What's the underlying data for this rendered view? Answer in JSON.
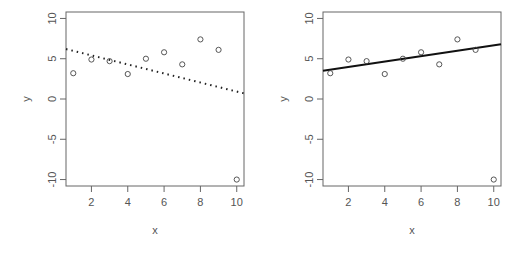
{
  "chart_data": [
    {
      "type": "scatter",
      "panel": "left",
      "title": "",
      "xlabel": "x",
      "ylabel": "y",
      "xlim": [
        0.6,
        10.4
      ],
      "ylim": [
        -10.8,
        10.8
      ],
      "xticks": [
        2,
        4,
        6,
        8,
        10
      ],
      "yticks": [
        -10,
        -5,
        0,
        5,
        10
      ],
      "grid": false,
      "x": [
        1,
        2,
        3,
        4,
        5,
        6,
        7,
        8,
        9,
        10
      ],
      "y": [
        3.2,
        4.9,
        4.7,
        3.1,
        5.0,
        5.8,
        4.3,
        7.4,
        6.1,
        -10.0
      ],
      "fit_line": {
        "style": "dotted",
        "x": [
          0.6,
          10.4
        ],
        "y": [
          6.2,
          0.7
        ],
        "color": "#222222"
      }
    },
    {
      "type": "scatter",
      "panel": "right",
      "title": "",
      "xlabel": "x",
      "ylabel": "y",
      "xlim": [
        0.6,
        10.4
      ],
      "ylim": [
        -10.8,
        10.8
      ],
      "xticks": [
        2,
        4,
        6,
        8,
        10
      ],
      "yticks": [
        -10,
        -5,
        0,
        5,
        10
      ],
      "grid": false,
      "x": [
        1,
        2,
        3,
        4,
        5,
        6,
        7,
        8,
        9,
        10
      ],
      "y": [
        3.2,
        4.9,
        4.7,
        3.1,
        5.0,
        5.8,
        4.3,
        7.4,
        6.1,
        -10.0
      ],
      "fit_line": {
        "style": "solid",
        "x": [
          0.6,
          10.4
        ],
        "y": [
          3.5,
          6.8
        ],
        "color": "#111111"
      }
    }
  ],
  "labels": {
    "left": {
      "xlabel": "x",
      "ylabel": "y",
      "xticks": [
        "2",
        "4",
        "6",
        "8",
        "10"
      ],
      "yticks": [
        "-10",
        "-5",
        "0",
        "5",
        "10"
      ]
    },
    "right": {
      "xlabel": "x",
      "ylabel": "y",
      "xticks": [
        "2",
        "4",
        "6",
        "8",
        "10"
      ],
      "yticks": [
        "-10",
        "-5",
        "0",
        "5",
        "10"
      ]
    }
  },
  "colors": {
    "axis": "#666666",
    "points": "#444444",
    "text": "#555555"
  }
}
